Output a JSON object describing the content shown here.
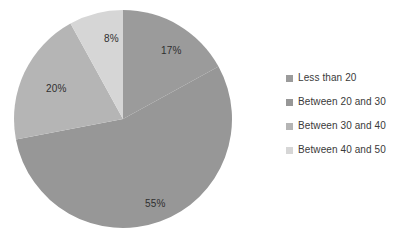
{
  "chart_data": {
    "type": "pie",
    "title": "",
    "subtitle": "",
    "xlabel": "",
    "ylabel": "",
    "grid": false,
    "legend_position": "right",
    "start_angle_deg": 0,
    "direction": "clockwise",
    "categories": [
      "Less than 20",
      "Between 20 and 30",
      "Between 30 and 40",
      "Between 40 and 50"
    ],
    "values": [
      17,
      55,
      20,
      8
    ],
    "value_unit": "%",
    "data_labels": [
      "17%",
      "55%",
      "20%",
      "8%"
    ],
    "colors": [
      "#9b9b9b",
      "#979797",
      "#b5b5b5",
      "#d6d6d6"
    ],
    "slices": [
      {
        "label": "Less than 20",
        "value": 17,
        "data_label": "17%",
        "color": "#9b9b9b"
      },
      {
        "label": "Between 20 and 30",
        "value": 55,
        "data_label": "55%",
        "color": "#979797"
      },
      {
        "label": "Between 30 and 40",
        "value": 20,
        "data_label": "20%",
        "color": "#b5b5b5"
      },
      {
        "label": "Between 40 and 50",
        "value": 8,
        "data_label": "8%",
        "color": "#d6d6d6"
      }
    ]
  },
  "legend": {
    "items": [
      {
        "label": "Less than 20",
        "color": "#9b9b9b"
      },
      {
        "label": "Between 20 and 30",
        "color": "#979797"
      },
      {
        "label": "Between 30 and 40",
        "color": "#b5b5b5"
      },
      {
        "label": "Between 40 and 50",
        "color": "#d6d6d6"
      }
    ]
  }
}
